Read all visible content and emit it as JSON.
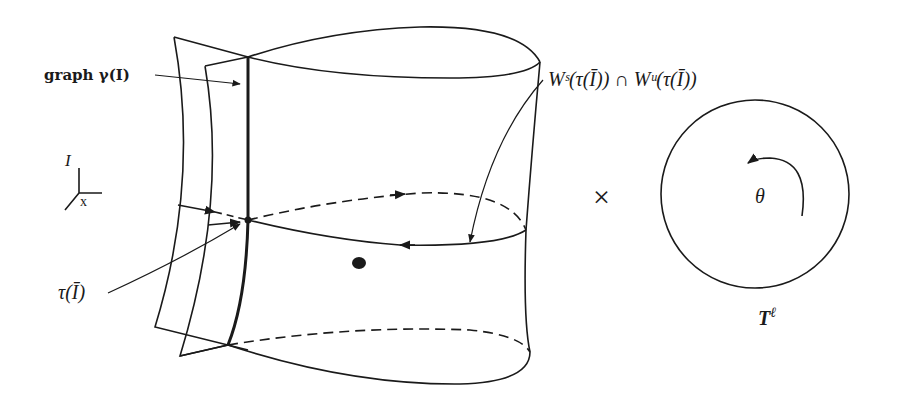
{
  "figure": {
    "labels": {
      "graph_gamma": "graph γ(I)",
      "intersection": "Wˢ(τ(Ī)) ∩ Wᵘ(τ(Ī))",
      "tau_I": "τ(Ī)",
      "axis_I": "I",
      "axis_x": "x",
      "times": "×",
      "theta": "θ",
      "torus": "T",
      "torus_exp": "ℓ"
    },
    "colors": {
      "ink": "#1a1a1a",
      "background": "#ffffff"
    }
  }
}
